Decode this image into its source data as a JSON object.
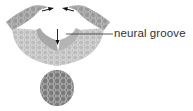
{
  "diagram": {
    "labels": [
      {
        "id": "neural-groove",
        "text": "neural groove"
      }
    ],
    "colors": {
      "ectoderm": "#9a9a9a",
      "mesoderm": "#bdbdbd",
      "groove_wall": "#a8a8a8",
      "notochord": "#7a7a7a",
      "cell_lines": "#e6e6e6",
      "arrow": "#111111",
      "leader_line": "#333333"
    }
  }
}
